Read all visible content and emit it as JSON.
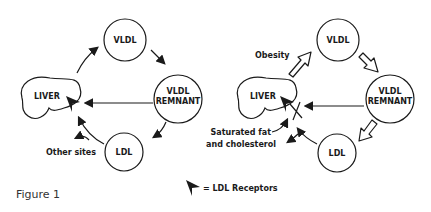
{
  "figure": {
    "caption": "Figure 1",
    "legend": {
      "symbol": "arrowhead",
      "text": "= LDL Receptors"
    },
    "left_panel": {
      "nodes": {
        "liver": "LIVER",
        "vldl": "VLDL",
        "vldl_remnant_line1": "VLDL",
        "vldl_remnant_line2": "REMNANT",
        "ldl": "LDL"
      },
      "labels": {
        "other_sites": "Other sites"
      }
    },
    "right_panel": {
      "nodes": {
        "liver": "LIVER",
        "vldl": "VLDL",
        "vldl_remnant_line1": "VLDL",
        "vldl_remnant_line2": "REMNANT",
        "ldl": "LDL"
      },
      "labels": {
        "obesity": "Obesity",
        "saturated_line1": "Saturated fat",
        "saturated_line2": "and cholesterol"
      }
    }
  }
}
